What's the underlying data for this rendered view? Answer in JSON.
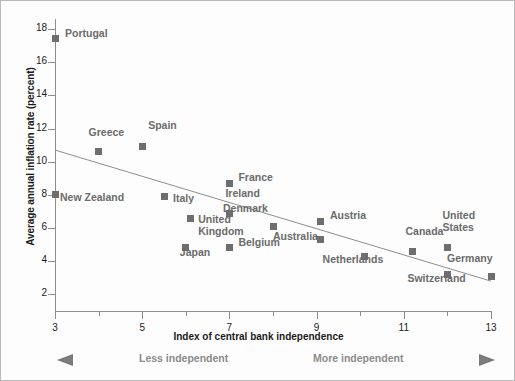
{
  "chart_data": {
    "type": "scatter",
    "title": "",
    "xlabel": "Index of central bank independence",
    "ylabel": "Average annual inflation rate (percent)",
    "xlim": [
      3,
      13
    ],
    "ylim": [
      1,
      18.6
    ],
    "xticks": [
      3,
      5,
      7,
      9,
      11,
      13
    ],
    "xticks_minor": [
      4,
      6,
      8,
      10,
      12
    ],
    "yticks": [
      2,
      4,
      6,
      8,
      10,
      12,
      14,
      16,
      18
    ],
    "grid": false,
    "legend": "none",
    "points": [
      {
        "label": "Portugal",
        "x": 3.0,
        "y": 17.4,
        "lx": 10,
        "ly": -6
      },
      {
        "label": "Greece",
        "x": 4.0,
        "y": 10.6,
        "lx": -10,
        "ly": -20
      },
      {
        "label": "Spain",
        "x": 5.0,
        "y": 10.9,
        "lx": 6,
        "ly": -22
      },
      {
        "label": "New Zealand",
        "x": 3.0,
        "y": 8.0,
        "lx": 5,
        "ly": 2
      },
      {
        "label": "Italy",
        "x": 5.5,
        "y": 7.9,
        "lx": 9,
        "ly": 1
      },
      {
        "label": "France",
        "x": 7.0,
        "y": 8.7,
        "lx": 9,
        "ly": -6
      },
      {
        "label": "Ireland",
        "x": 7.0,
        "y": 6.9,
        "lx": -4,
        "ly": -20
      },
      {
        "label": "United\nKingdom",
        "x": 6.1,
        "y": 6.6,
        "lx": 8,
        "ly": 1
      },
      {
        "label": "Denmark",
        "x": 8.0,
        "y": 6.1,
        "lx": -50,
        "ly": -18
      },
      {
        "label": "Austria",
        "x": 9.1,
        "y": 6.4,
        "lx": 9,
        "ly": -6
      },
      {
        "label": "Belgium",
        "x": 7.0,
        "y": 4.8,
        "lx": 9,
        "ly": -6
      },
      {
        "label": "Japan",
        "x": 6.0,
        "y": 4.8,
        "lx": -6,
        "ly": 4
      },
      {
        "label": "Australia",
        "x": 9.1,
        "y": 5.3,
        "lx": -48,
        "ly": -4
      },
      {
        "label": "Netherlands",
        "x": 10.1,
        "y": 4.3,
        "lx": -42,
        "ly": 3
      },
      {
        "label": "Canada",
        "x": 11.2,
        "y": 4.6,
        "lx": -7,
        "ly": -20
      },
      {
        "label": "Switzerland",
        "x": 12.0,
        "y": 3.2,
        "lx": -40,
        "ly": 3
      },
      {
        "label": "United\nStates",
        "x": 12.0,
        "y": 4.8,
        "lx": -5,
        "ly": -33
      },
      {
        "label": "Germany",
        "x": 13.0,
        "y": 3.1,
        "lx": -44,
        "ly": -18
      }
    ],
    "trendline": {
      "x0": 3,
      "y0": 10.7,
      "x1": 13.0,
      "y1": 2.8
    }
  },
  "axes": {
    "x_title": "Index of central bank independence",
    "y_title": "Average annual inflation rate (percent)",
    "x_tick_labels": [
      "3",
      "5",
      "7",
      "9",
      "11",
      "13"
    ],
    "y_tick_labels": [
      "2",
      "4",
      "6",
      "8",
      "10",
      "12",
      "14",
      "16",
      "18"
    ]
  },
  "annotations": {
    "less_independent": "Less independent",
    "more_independent": "More independent"
  },
  "colors": {
    "marker": "#6e6e6e",
    "label": "#6b6b6b",
    "axis": "#8d8d8d",
    "tick_text": "#1b1b1b",
    "trend": "#8d8d8d",
    "arrow": "#8b8b8b",
    "background": "#fdfdfd",
    "border": "#b9b9b9"
  }
}
